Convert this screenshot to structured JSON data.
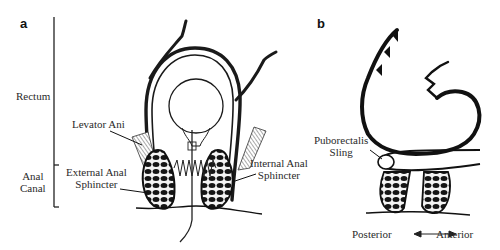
{
  "figure": {
    "panels": [
      {
        "id": "a",
        "letter": "a",
        "region_labels": {
          "rectum": "Rectum",
          "anal_canal_line1": "Anal",
          "anal_canal_line2": "Canal"
        },
        "structure_labels": {
          "levator_ani": "Levator Ani",
          "external_line1": "External Anal",
          "external_line2": "Sphincter",
          "internal_line1": "Internal Anal",
          "internal_line2": "Sphincter"
        }
      },
      {
        "id": "b",
        "letter": "b",
        "structure_labels": {
          "puborectalis_line1": "Puborectalis",
          "puborectalis_line2": "Sling"
        },
        "orientation": {
          "posterior": "Posterior",
          "anterior": "Anterior",
          "arrow": "double-headed"
        }
      }
    ],
    "colors": {
      "ink": "#1a1a1a",
      "text": "#2a2a2a",
      "background": "#ffffff"
    }
  }
}
